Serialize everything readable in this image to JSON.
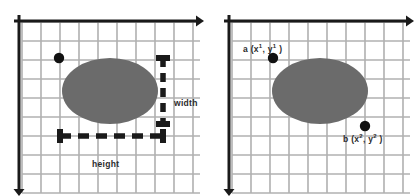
{
  "figure": {
    "type": "diagram",
    "background_color": "#ffffff",
    "grid_line_color": "#b0b0b0",
    "axis_color": "#1a1a1a",
    "ellipse_fill_color": "#6b6b6b",
    "point_color": "#111111",
    "annotation_color": "#2b2b2b"
  },
  "panels": [
    {
      "id": "left",
      "name": "width-height-panel",
      "grid": {
        "origin_x": 22,
        "origin_y": 22,
        "cell_size": 19,
        "columns": 9,
        "rows": 9
      },
      "axes": {
        "x_axis_label": "",
        "y_axis_label": "",
        "x_arrow_direction": "right",
        "y_arrow_direction": "down"
      },
      "ellipse": {
        "cx": 110,
        "cy": 91,
        "rx": 48,
        "ry": 33
      },
      "points": [
        {
          "name": "corner-dot",
          "cx": 59,
          "cy": 58,
          "r": 5.2,
          "label": ""
        }
      ],
      "measures": [
        {
          "name": "width-measure",
          "orientation": "vertical",
          "label": "width",
          "x": 163,
          "y_start": 58,
          "y_end": 124,
          "label_x": 174,
          "label_y": 99
        },
        {
          "name": "height-measure",
          "orientation": "horizontal",
          "label": "height",
          "y": 136,
          "x_start": 60,
          "x_end": 163,
          "label_x": 92,
          "label_y": 160
        }
      ]
    },
    {
      "id": "right",
      "name": "point-coordinates-panel",
      "grid": {
        "origin_x": 22,
        "origin_y": 22,
        "cell_size": 19,
        "columns": 9,
        "rows": 9
      },
      "axes": {
        "x_axis_label": "",
        "y_axis_label": "",
        "x_arrow_direction": "right",
        "y_arrow_direction": "down"
      },
      "ellipse": {
        "cx": 110,
        "cy": 91,
        "rx": 48,
        "ry": 33
      },
      "points": [
        {
          "name": "point-a",
          "cx": 63,
          "cy": 58,
          "r": 5.2,
          "label_text": "a (x",
          "label_sup1": "1",
          "label_mid": ", y",
          "label_sup2": "1",
          "label_end": " )"
        },
        {
          "name": "point-b",
          "cx": 155,
          "cy": 126,
          "r": 5.2,
          "label_text": "b (x",
          "label_sup1": "2",
          "label_mid": ", y",
          "label_sup2": "2",
          "label_end": " )"
        }
      ]
    }
  ],
  "labels": {
    "width": "width",
    "height": "height",
    "point_a": {
      "base": "a (x",
      "sup1": "1",
      "mid": ", y",
      "sup2": "1",
      "end": " )"
    },
    "point_b": {
      "base": "b (x",
      "sup1": "2",
      "mid": ", y",
      "sup2": "2",
      "end": " )"
    }
  }
}
